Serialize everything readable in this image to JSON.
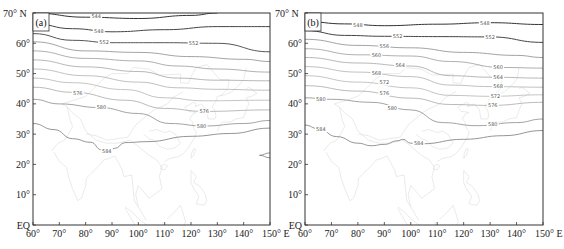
{
  "chart_data": [
    {
      "type": "line",
      "subtype": "geopotential-height contour map",
      "panel_label": "(a)",
      "x_range_lon": [
        60,
        150
      ],
      "y_range_lat": [
        0,
        70
      ],
      "x_ticks": [
        "60°",
        "70°",
        "80°",
        "90°",
        "100°",
        "110°",
        "120°",
        "130°",
        "140°",
        "150° E"
      ],
      "y_ticks": [
        "EQ",
        "10°",
        "20°",
        "30°",
        "40°",
        "50°",
        "60°",
        "70° N"
      ],
      "contour_interval": 4,
      "contours": [
        {
          "level": 544,
          "color": "#333333",
          "points": [
            [
              60,
              70
            ],
            [
              80,
              68.6
            ],
            [
              100,
              68.2
            ],
            [
              120,
              69.2
            ],
            [
              130,
              70
            ]
          ],
          "label_at": [
            84,
            68.8
          ]
        },
        {
          "level": 548,
          "color": "#444444",
          "points": [
            [
              60,
              66.5
            ],
            [
              75,
              64.8
            ],
            [
              90,
              63.8
            ],
            [
              110,
              64.5
            ],
            [
              130,
              65.5
            ],
            [
              150,
              65.5
            ]
          ],
          "label_at": [
            85,
            64.0
          ]
        },
        {
          "level": 552,
          "color": "#555555",
          "points": [
            [
              60,
              63.2
            ],
            [
              75,
              61.0
            ],
            [
              90,
              60.2
            ],
            [
              110,
              60.2
            ],
            [
              130,
              60.0
            ],
            [
              150,
              57.2
            ]
          ],
          "label_at": [
            87,
            60.2
          ],
          "label2_at": [
            121,
            60.1
          ]
        },
        {
          "level": 556,
          "color": "#8a8a8a",
          "points": [
            [
              60,
              60.5
            ],
            [
              80,
              57.5
            ],
            [
              100,
              57.0
            ],
            [
              120,
              55.6
            ],
            [
              140,
              54.7
            ],
            [
              150,
              54.0
            ]
          ]
        },
        {
          "level": 560,
          "color": "#9a9a9a",
          "points": [
            [
              60,
              57.5
            ],
            [
              80,
              55.0
            ],
            [
              100,
              54.2
            ],
            [
              115,
              52.5
            ],
            [
              130,
              51.5
            ],
            [
              150,
              50.5
            ]
          ]
        },
        {
          "level": 564,
          "color": "#a5a5a5",
          "points": [
            [
              60,
              54.5
            ],
            [
              80,
              52.2
            ],
            [
              100,
              50.7
            ],
            [
              115,
              48.5
            ],
            [
              130,
              47.8
            ],
            [
              150,
              47.6
            ]
          ]
        },
        {
          "level": 568,
          "color": "#b0b0b0",
          "points": [
            [
              60,
              51.5
            ],
            [
              80,
              49.3
            ],
            [
              100,
              47.2
            ],
            [
              115,
              45.3
            ],
            [
              130,
              44.8
            ],
            [
              150,
              44.5
            ]
          ]
        },
        {
          "level": 572,
          "color": "#b5b5b5",
          "points": [
            [
              60,
              48.5
            ],
            [
              75,
              47.0
            ],
            [
              95,
              44.7
            ],
            [
              110,
              42.0
            ],
            [
              125,
              41.0
            ],
            [
              150,
              41.2
            ]
          ]
        },
        {
          "level": 576,
          "color": "#a8a8a8",
          "points": [
            [
              60,
              45.5
            ],
            [
              75,
              43.8
            ],
            [
              95,
              41.2
            ],
            [
              110,
              38.5
            ],
            [
              125,
              37.5
            ],
            [
              150,
              38.0
            ]
          ],
          "label_at": [
            77,
            43.5
          ],
          "label2_at": [
            125,
            37.5
          ]
        },
        {
          "level": 580,
          "color": "#8c8c8c",
          "points": [
            [
              60,
              41.5
            ],
            [
              70,
              40.0
            ],
            [
              85,
              38.8
            ],
            [
              100,
              36.8
            ],
            [
              112,
              33.5
            ],
            [
              125,
              32.7
            ],
            [
              140,
              33.5
            ],
            [
              150,
              34.5
            ]
          ],
          "label_at": [
            86,
            38.8
          ],
          "label2_at": [
            124,
            32.7
          ]
        },
        {
          "level": 584,
          "color": "#7a7a7a",
          "points": [
            [
              60,
              33.5
            ],
            [
              68,
              31.5
            ],
            [
              75,
              28.5
            ],
            [
              82,
              27.3
            ],
            [
              86,
              24.8
            ],
            [
              88,
              24.2
            ],
            [
              91,
              25.3
            ],
            [
              95,
              27.2
            ],
            [
              103,
              27.5
            ],
            [
              120,
              29.3
            ],
            [
              135,
              30.2
            ],
            [
              150,
              32.0
            ]
          ],
          "label_at": [
            88,
            24.5
          ]
        },
        {
          "level": 584,
          "color": "#7a7a7a",
          "note": "closed contour fragment near 145-150E, 23N",
          "points": [
            [
              150,
              23.8
            ],
            [
              146,
              23.0
            ],
            [
              150,
              22.2
            ]
          ]
        }
      ]
    },
    {
      "type": "line",
      "subtype": "geopotential-height contour map",
      "panel_label": "(b)",
      "x_range_lon": [
        60,
        150
      ],
      "y_range_lat": [
        0,
        70
      ],
      "x_ticks": [
        "60°",
        "70°",
        "80°",
        "90°",
        "100°",
        "110°",
        "120°",
        "130°",
        "140°",
        "150° E"
      ],
      "y_ticks": [
        "EQ",
        "10°",
        "20°",
        "30°",
        "40°",
        "50°",
        "60°",
        "70° N"
      ],
      "contour_interval": 4,
      "contours": [
        {
          "level": 548,
          "color": "#333333",
          "points": [
            [
              60,
              67.2
            ],
            [
              75,
              66.4
            ],
            [
              90,
              65.8
            ],
            [
              110,
              66.3
            ],
            [
              130,
              66.8
            ],
            [
              150,
              66.2
            ]
          ],
          "label_at": [
            80,
            65.9
          ],
          "label2_at": [
            128,
            66.6
          ]
        },
        {
          "level": 552,
          "color": "#444444",
          "points": [
            [
              60,
              64.2
            ],
            [
              75,
              62.6
            ],
            [
              90,
              62.3
            ],
            [
              110,
              62.2
            ],
            [
              130,
              62.1
            ],
            [
              150,
              60.3
            ]
          ],
          "label_at": [
            95,
            62.2
          ],
          "label2_at": [
            130,
            62.0
          ]
        },
        {
          "level": 556,
          "color": "#8a8a8a",
          "points": [
            [
              60,
              61.3
            ],
            [
              80,
              59.3
            ],
            [
              100,
              58.5
            ],
            [
              120,
              57.0
            ],
            [
              140,
              56.0
            ],
            [
              150,
              55.3
            ]
          ],
          "label_at": [
            90,
            59.2
          ]
        },
        {
          "level": 560,
          "color": "#9a9a9a",
          "points": [
            [
              60,
              58.2
            ],
            [
              80,
              56.2
            ],
            [
              100,
              55.8
            ],
            [
              115,
              54.0
            ],
            [
              135,
              52.0
            ],
            [
              150,
              51.8
            ]
          ],
          "label_at": [
            87,
            56.0
          ],
          "label2_at": [
            133,
            52.2
          ]
        },
        {
          "level": 564,
          "color": "#a5a5a5",
          "points": [
            [
              60,
              55.3
            ],
            [
              80,
              53.5
            ],
            [
              100,
              52.5
            ],
            [
              115,
              49.3
            ],
            [
              130,
              48.8
            ],
            [
              150,
              48.5
            ]
          ],
          "label_at": [
            96,
            52.6
          ],
          "label2_at": [
            133,
            48.8
          ]
        },
        {
          "level": 568,
          "color": "#b0b0b0",
          "points": [
            [
              60,
              52.3
            ],
            [
              80,
              50.5
            ],
            [
              100,
              49.0
            ],
            [
              115,
              46.2
            ],
            [
              130,
              45.7
            ],
            [
              150,
              45.5
            ]
          ],
          "label_at": [
            87,
            50.2
          ],
          "label2_at": [
            133,
            45.9
          ]
        },
        {
          "level": 572,
          "color": "#b5b5b5",
          "points": [
            [
              60,
              49.3
            ],
            [
              80,
              47.2
            ],
            [
              100,
              45.3
            ],
            [
              115,
              42.8
            ],
            [
              130,
              42.5
            ],
            [
              150,
              43.0
            ]
          ],
          "label_at": [
            90,
            47.0
          ],
          "label2_at": [
            132,
            42.6
          ]
        },
        {
          "level": 576,
          "color": "#a8a8a8",
          "points": [
            [
              60,
              46.0
            ],
            [
              80,
              44.2
            ],
            [
              100,
              41.9
            ],
            [
              115,
              39.8
            ],
            [
              130,
              39.5
            ],
            [
              150,
              40.5
            ]
          ],
          "label_at": [
            90,
            43.6
          ],
          "label2_at": [
            131,
            39.5
          ]
        },
        {
          "level": 580,
          "color": "#8c8c8c",
          "points": [
            [
              60,
              42.0
            ],
            [
              70,
              41.5
            ],
            [
              85,
              40.5
            ],
            [
              100,
              38.0
            ],
            [
              112,
              33.8
            ],
            [
              125,
              32.8
            ],
            [
              140,
              33.8
            ],
            [
              150,
              35.0
            ]
          ],
          "label_at": [
            66,
            41.6
          ],
          "label2_at": [
            93,
            38.6
          ],
          "label3_at": [
            131,
            33.2
          ]
        },
        {
          "level": 584,
          "color": "#7a7a7a",
          "points": [
            [
              60,
              33.0
            ],
            [
              65,
              31.8
            ],
            [
              72,
              29.2
            ],
            [
              80,
              27.0
            ],
            [
              85,
              26.2
            ],
            [
              90,
              26.6
            ],
            [
              95,
              27.8
            ],
            [
              97,
              28.3
            ],
            [
              100,
              27.0
            ],
            [
              104,
              26.8
            ],
            [
              120,
              28.3
            ],
            [
              135,
              29.5
            ],
            [
              150,
              31.2
            ]
          ],
          "label_at": [
            66,
            31.5
          ],
          "label2_at": [
            103,
            26.9
          ]
        }
      ]
    }
  ],
  "figure": {
    "panel_a_label": "(a)",
    "panel_b_label": "(b)",
    "background": "#ffffff",
    "frame_color": "#333333",
    "coastline_color": "#dcdcdc"
  }
}
